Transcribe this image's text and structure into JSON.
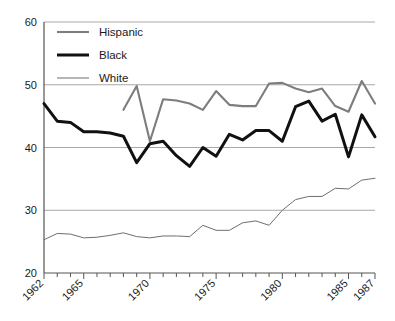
{
  "chart_data": {
    "type": "line",
    "title": "",
    "subtitle": "",
    "xlabel": "",
    "ylabel": "",
    "xlim": [
      1962,
      1987
    ],
    "ylim": [
      20,
      60
    ],
    "grid": true,
    "grid_axis": "y",
    "legend_position": "top-left",
    "y_ticks": [
      20,
      30,
      40,
      50,
      60
    ],
    "y_tick_labels": [
      "20",
      "30",
      "40",
      "50",
      "60"
    ],
    "x_ticks": [
      1962,
      1963,
      1964,
      1965,
      1966,
      1967,
      1968,
      1969,
      1970,
      1971,
      1972,
      1973,
      1974,
      1975,
      1976,
      1977,
      1978,
      1979,
      1980,
      1981,
      1982,
      1983,
      1984,
      1985,
      1986,
      1987
    ],
    "x_tick_labels_shown": [
      "1962",
      "1965",
      "1970",
      "1975",
      "1980",
      "1985",
      "1987"
    ],
    "x_tick_label_years": [
      1962,
      1965,
      1970,
      1975,
      1980,
      1985,
      1987
    ],
    "x_tick_label_rotation": -45,
    "series": [
      {
        "name": "Hispanic",
        "color": "#7d7d7d",
        "line_width": 2.1,
        "x": [
          1968,
          1969,
          1970,
          1971,
          1972,
          1973,
          1974,
          1975,
          1976,
          1977,
          1978,
          1979,
          1980,
          1981,
          1982,
          1983,
          1984,
          1985,
          1986,
          1987
        ],
        "values": [
          46.0,
          49.8,
          41.0,
          47.7,
          47.5,
          47.0,
          46.0,
          49.0,
          46.8,
          46.6,
          46.6,
          50.2,
          50.3,
          49.4,
          48.8,
          49.4,
          46.6,
          45.7,
          50.6,
          47.0
        ]
      },
      {
        "name": "Black",
        "color": "#111111",
        "line_width": 3.0,
        "x": [
          1962,
          1963,
          1964,
          1965,
          1966,
          1967,
          1968,
          1969,
          1970,
          1971,
          1972,
          1973,
          1974,
          1975,
          1976,
          1977,
          1978,
          1979,
          1980,
          1981,
          1982,
          1983,
          1984,
          1985,
          1986,
          1987
        ],
        "values": [
          47.0,
          44.2,
          44.0,
          42.5,
          42.5,
          42.3,
          41.8,
          37.6,
          40.6,
          41.0,
          38.7,
          37.0,
          40.0,
          38.6,
          42.1,
          41.2,
          42.7,
          42.7,
          41.0,
          46.5,
          47.4,
          44.2,
          45.3,
          38.5,
          45.2,
          41.7
        ]
      },
      {
        "name": "White",
        "color": "#6e6e6e",
        "line_width": 1.0,
        "x": [
          1962,
          1963,
          1964,
          1965,
          1966,
          1967,
          1968,
          1969,
          1970,
          1971,
          1972,
          1973,
          1974,
          1975,
          1976,
          1977,
          1978,
          1979,
          1980,
          1981,
          1982,
          1983,
          1984,
          1985,
          1986,
          1987
        ],
        "values": [
          25.3,
          26.3,
          26.2,
          25.6,
          25.7,
          26.0,
          26.4,
          25.8,
          25.6,
          25.9,
          25.9,
          25.8,
          27.6,
          26.8,
          26.8,
          28.0,
          28.3,
          27.6,
          30.0,
          31.7,
          32.2,
          32.2,
          33.5,
          33.4,
          34.8,
          35.1
        ]
      }
    ],
    "legend": [
      {
        "label": "Hispanic",
        "color": "#7d7d7d",
        "line_width": 2.1
      },
      {
        "label": "Black",
        "color": "#111111",
        "line_width": 3.0
      },
      {
        "label": "White",
        "color": "#6e6e6e",
        "line_width": 1.0
      }
    ],
    "style": {
      "axis_color": "#555555",
      "grid_color": "#a8a8a8",
      "background": "#ffffff",
      "plot_left": 44,
      "plot_right": 375,
      "plot_top": 22,
      "plot_bottom": 273
    }
  }
}
